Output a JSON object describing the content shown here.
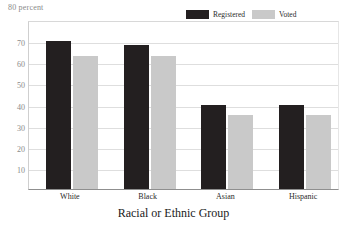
{
  "chart_data": {
    "type": "bar",
    "title": "",
    "unit_label": "80 percent",
    "xlabel": "Racial or Ethnic Group",
    "ylabel": "percent",
    "categories": [
      "White",
      "Black",
      "Asian",
      "Hispanic"
    ],
    "series": [
      {
        "name": "Registered",
        "color": "#231f20",
        "values": [
          70,
          68,
          40,
          40
        ]
      },
      {
        "name": "Voted",
        "color": "#c9c9c9",
        "values": [
          63,
          63,
          35,
          35
        ]
      }
    ],
    "ylim": [
      0,
      80
    ],
    "yticks": [
      70,
      60,
      50,
      40,
      30,
      20,
      10
    ],
    "ytick_labels": [
      "70",
      "60",
      "50",
      "40",
      "30",
      "20",
      "10"
    ],
    "grid": true,
    "legend_position": "top-right"
  },
  "legend": {
    "items": [
      {
        "label": "Registered",
        "swatch": "legend-swatch-registered"
      },
      {
        "label": "Voted",
        "swatch": "legend-swatch-voted"
      }
    ]
  },
  "colors": {
    "registered": "#231f20",
    "voted": "#c9c9c9",
    "gridline": "#dedede",
    "axis": "#8f8f8f",
    "tick_text": "#8a8a8a",
    "label_text": "#2b2b2b"
  }
}
